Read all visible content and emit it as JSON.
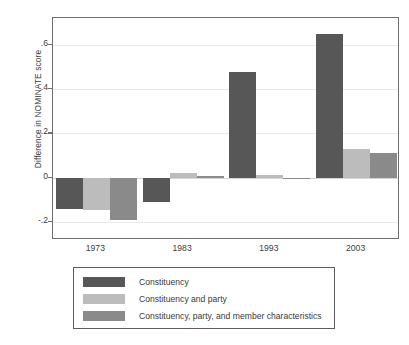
{
  "chart_data": {
    "type": "bar",
    "title": "",
    "subtitle": "",
    "xlabel": "",
    "ylabel": "Difference in NOMINATE score",
    "categories": [
      "1973",
      "1983",
      "1993",
      "2003"
    ],
    "ylim": [
      -0.28,
      0.72
    ],
    "yticks": [
      0.6,
      0.4,
      0.2,
      0,
      -0.2
    ],
    "ytick_labels": [
      ".6",
      ".4",
      ".2",
      "0",
      "-.2"
    ],
    "grid": true,
    "legend_position": "below-plot",
    "series": [
      {
        "name": "Constituency",
        "color": "#575757",
        "values": [
          -0.14,
          -0.11,
          0.475,
          0.65
        ]
      },
      {
        "name": "Constituency and party",
        "color": "#bcbcbc",
        "values": [
          -0.145,
          0.02,
          0.015,
          0.13
        ]
      },
      {
        "name": "Constituency, party, and member characteristics",
        "color": "#8a8a8a",
        "values": [
          -0.19,
          0.01,
          -0.005,
          0.11
        ]
      }
    ]
  },
  "axis": {
    "y_title": "Difference in NOMINATE score",
    "y_tick_labels": [
      ".6",
      ".4",
      ".2",
      "0",
      "-.2"
    ],
    "x_tick_labels": [
      "1973",
      "1983",
      "1993",
      "2003"
    ]
  },
  "legend": {
    "items": [
      {
        "label": "Constituency",
        "color": "#575757"
      },
      {
        "label": "Constituency and party",
        "color": "#bcbcbc"
      },
      {
        "label": "Constituency, party, and member characteristics",
        "color": "#8a8a8a"
      }
    ]
  }
}
